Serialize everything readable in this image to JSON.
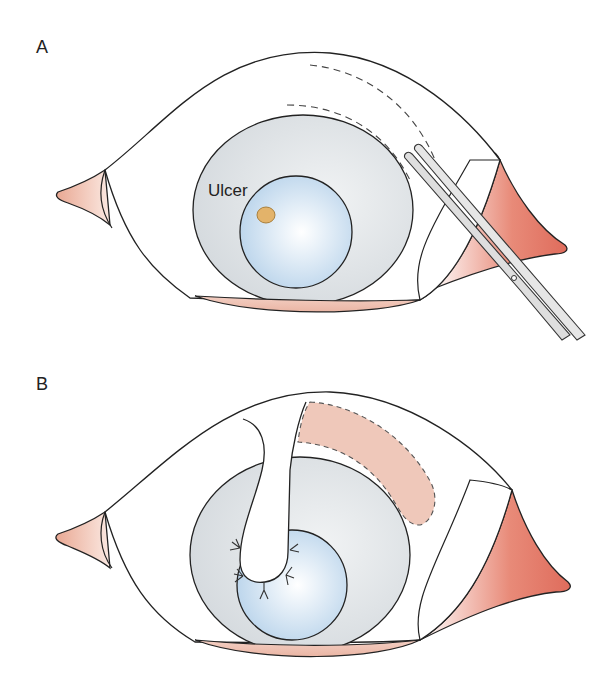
{
  "figure": {
    "panels": [
      {
        "id": "A",
        "label": "A",
        "annotations": [
          {
            "text": "Ulcer"
          }
        ],
        "elements": [
          "eye",
          "cornea-ulcer",
          "conjunctival-incision-dashed-lines",
          "scissors"
        ]
      },
      {
        "id": "B",
        "label": "B",
        "annotations": [],
        "elements": [
          "eye",
          "conjunctival-pedicle-flap",
          "sutures",
          "donor-site-dashed-outline"
        ]
      }
    ],
    "colors": {
      "outline": "#222222",
      "sclera_gray": "#dfe3e6",
      "cornea_blue": "#c6dcee",
      "ulcer_orange": "#e3b36a",
      "caruncle_pink": "#f0c2b2",
      "canthus_red": "#e07a6a",
      "donor_site_pink": "#efc8ba",
      "instrument_gray": "#dcdcdc"
    }
  }
}
